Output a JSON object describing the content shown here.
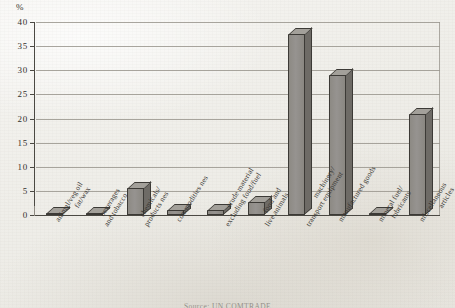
{
  "chart_data": {
    "type": "bar",
    "title": "",
    "xlabel": "",
    "ylabel": "%",
    "ylim": [
      0,
      40
    ],
    "ytick_step": 5,
    "grid": true,
    "legend": "none",
    "categories": [
      "animal/veg oil fat/wax",
      "beverages and tobacco",
      "chemicals/ products nes",
      "commodities nes",
      "crude material excluding food/fuel",
      "food and live animals",
      "machinery/ transport equipment",
      "manufactured goods",
      "mineral fuel/ lubricants",
      "miscellaneous articles"
    ],
    "values": [
      0.3,
      0.4,
      5.5,
      1.0,
      1.0,
      2.7,
      37.6,
      29.0,
      0.3,
      20.9
    ],
    "ytick_labels": [
      "0",
      "5",
      "10",
      "15",
      "20",
      "25",
      "30",
      "35",
      "40"
    ],
    "bar_color": "#8d8a84",
    "bar_edge_color": "#3c3a36"
  },
  "axis": {
    "unit_label": "%",
    "ticks": [
      {
        "value": "40",
        "y": 0
      },
      {
        "value": "35",
        "y": 24.125
      },
      {
        "value": "30",
        "y": 48.25
      },
      {
        "value": "25",
        "y": 72.375
      },
      {
        "value": "20",
        "y": 96.5
      },
      {
        "value": "15",
        "y": 120.625
      },
      {
        "value": "10",
        "y": 144.75
      },
      {
        "value": "5",
        "y": 168.875
      },
      {
        "value": "0",
        "y": 193
      }
    ]
  },
  "categories_display": [
    {
      "line1": "animal/veg oil",
      "line2": "fat/wax"
    },
    {
      "line1": "beverages",
      "line2": "and tobacco"
    },
    {
      "line1": "chemicals/",
      "line2": "products nes"
    },
    {
      "line1": "commodities nes",
      "line2": ""
    },
    {
      "line1": "crude material",
      "line2": "excluding food/fuel"
    },
    {
      "line1": "food and",
      "line2": "live animals"
    },
    {
      "line1": "machinery/",
      "line2": "transport equipment"
    },
    {
      "line1": "manufactured goods",
      "line2": ""
    },
    {
      "line1": "mineral fuel/",
      "line2": "lubricants"
    },
    {
      "line1": "miscellaneous",
      "line2": "articles"
    }
  ],
  "footer": {
    "source_text": "Source:   UN COMTRADE"
  }
}
